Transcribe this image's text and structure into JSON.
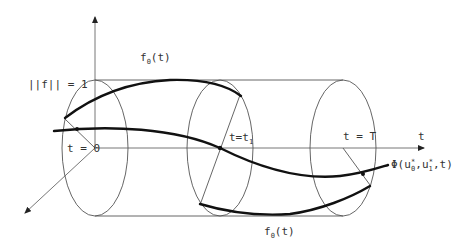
{
  "diagram": {
    "labels": {
      "norm": "||f|| = 1",
      "f0_top": "f",
      "f0_top_sub": "0",
      "f0_top_arg": "(t)",
      "f0_bottom": "f",
      "f0_bottom_sub": "0",
      "f0_bottom_arg": "(t)",
      "t_zero": "t = 0",
      "t_one": "t=t",
      "t_one_sub": "1",
      "t_final": "t = T",
      "t_axis": "t",
      "phi": "Φ(u",
      "phi_sub0": "0",
      "phi_mid": ",u",
      "phi_sub1": "1",
      "phi_end": ",t)",
      "star": "*"
    },
    "cross_sections": [
      {
        "name": "t = 0",
        "cx": 95
      },
      {
        "name": "t = t1",
        "cx": 220
      },
      {
        "name": "t = T",
        "cx": 343
      }
    ],
    "colors": {
      "background": "#ffffff",
      "thin_line": "#555555",
      "thick_curve": "#111111",
      "text": "#333333"
    }
  }
}
